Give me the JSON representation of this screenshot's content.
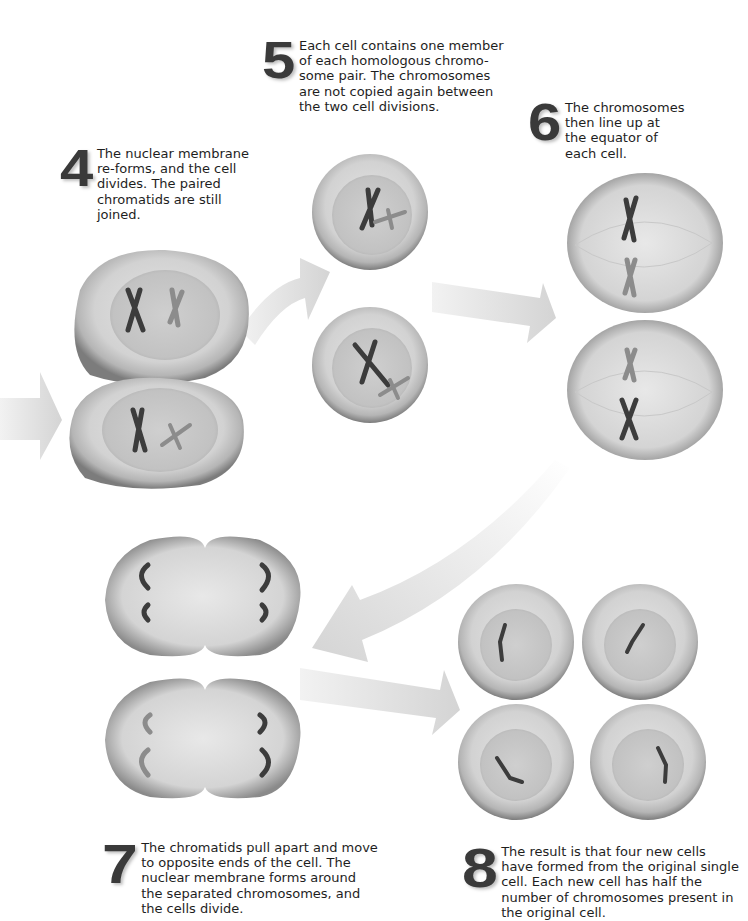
{
  "stages": [
    {
      "number": "4",
      "text": "The nuclear membrane\nre-forms, and the cell\ndivides. The paired\nchromatids are still\njoined."
    },
    {
      "number": "5",
      "text": "Each cell contains one member\nof each homologous chromo-\nsome pair. The chromosomes\nare not copied again between\nthe two cell divisions."
    },
    {
      "number": "6",
      "text": "The chromosomes\nthen line up at\nthe equator of\neach cell."
    },
    {
      "number": "7",
      "text": "The chromatids pull apart and move\nto opposite ends of the cell. The\nnuclear membrane forms around\nthe separated chromosomes, and\nthe cells divide."
    },
    {
      "number": "8",
      "text": "The result is that four new cells\nhave formed from the original single\ncell. Each new cell has half the\nnumber of chromosomes present in\nthe original cell."
    }
  ],
  "colors": {
    "number": "#3a3a3a",
    "cell_edge": "#7a7a7a",
    "cell_fill": "#d6d6d6",
    "nucleus": "#c4c4c4",
    "chromosome_dark": "#3c3c3c",
    "chromosome_light": "#8c8c8c",
    "arrow": "#d9d9d9"
  }
}
